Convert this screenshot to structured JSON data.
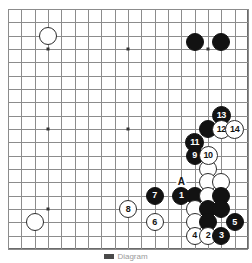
{
  "diagram": {
    "board_size": 19,
    "grid_lines": 19,
    "colors": {
      "board_background": "#ffffff",
      "grid_line": "#8c8c8c",
      "border": "#6b6b6b",
      "black_stone": "#121212",
      "white_stone": "#ffffff",
      "stone_outline": "#2b2b2b",
      "label_text": "#111111"
    },
    "star_points": [
      {
        "col": 3,
        "row": 3
      },
      {
        "col": 9,
        "row": 3
      },
      {
        "col": 15,
        "row": 3
      },
      {
        "col": 3,
        "row": 9
      },
      {
        "col": 9,
        "row": 9
      },
      {
        "col": 15,
        "row": 9
      },
      {
        "col": 3,
        "row": 15
      },
      {
        "col": 9,
        "row": 15
      },
      {
        "col": 15,
        "row": 15
      }
    ],
    "stones": [
      {
        "id": "w-upper-left",
        "color": "white",
        "label": "",
        "col": 3,
        "row": 2
      },
      {
        "id": "b-top-right-a",
        "color": "black",
        "label": "",
        "col": 14,
        "row": 2.5
      },
      {
        "id": "b-top-right-b",
        "color": "black",
        "label": "",
        "col": 16,
        "row": 2.5
      },
      {
        "id": "w-lower-left",
        "color": "white",
        "label": "",
        "col": 2,
        "row": 16
      },
      {
        "id": "move-13",
        "color": "black",
        "label": "13",
        "col": 16,
        "row": 8
      },
      {
        "id": "move-12",
        "color": "white",
        "label": "12",
        "col": 16,
        "row": 9
      },
      {
        "id": "move-14",
        "color": "white",
        "label": "14",
        "col": 17,
        "row": 9
      },
      {
        "id": "b-plain-1",
        "color": "black",
        "label": "",
        "col": 15,
        "row": 9
      },
      {
        "id": "move-11",
        "color": "black",
        "label": "11",
        "col": 14,
        "row": 10
      },
      {
        "id": "move-9",
        "color": "black",
        "label": "9",
        "col": 14,
        "row": 11
      },
      {
        "id": "move-10",
        "color": "white",
        "label": "10",
        "col": 15,
        "row": 11
      },
      {
        "id": "w-plain-1",
        "color": "white",
        "label": "",
        "col": 15,
        "row": 12
      },
      {
        "id": "w-plain-2",
        "color": "white",
        "label": "",
        "col": 15,
        "row": 13
      },
      {
        "id": "w-plain-3",
        "color": "white",
        "label": "",
        "col": 16,
        "row": 13
      },
      {
        "id": "move-1",
        "color": "black",
        "label": "1",
        "col": 13,
        "row": 14
      },
      {
        "id": "b-plain-2",
        "color": "black",
        "label": "",
        "col": 14,
        "row": 14
      },
      {
        "id": "w-plain-4",
        "color": "white",
        "label": "",
        "col": 15,
        "row": 14
      },
      {
        "id": "b-plain-3",
        "color": "black",
        "label": "",
        "col": 16,
        "row": 14
      },
      {
        "id": "move-7",
        "color": "black",
        "label": "7",
        "col": 11,
        "row": 14
      },
      {
        "id": "w-plain-5",
        "color": "white",
        "label": "",
        "col": 14,
        "row": 15
      },
      {
        "id": "b-plain-4",
        "color": "black",
        "label": "",
        "col": 15,
        "row": 15
      },
      {
        "id": "b-plain-5",
        "color": "black",
        "label": "",
        "col": 16,
        "row": 15
      },
      {
        "id": "move-8",
        "color": "white",
        "label": "8",
        "col": 9,
        "row": 15
      },
      {
        "id": "w-plain-6",
        "color": "white",
        "label": "",
        "col": 14,
        "row": 16
      },
      {
        "id": "b-plain-6",
        "color": "black",
        "label": "",
        "col": 15,
        "row": 16
      },
      {
        "id": "move-5",
        "color": "black",
        "label": "5",
        "col": 17,
        "row": 16
      },
      {
        "id": "move-6",
        "color": "white",
        "label": "6",
        "col": 11,
        "row": 16
      },
      {
        "id": "move-4",
        "color": "white",
        "label": "4",
        "col": 14,
        "row": 17
      },
      {
        "id": "move-2",
        "color": "white",
        "label": "2",
        "col": 15,
        "row": 17
      },
      {
        "id": "move-3",
        "color": "black",
        "label": "3",
        "col": 16,
        "row": 17
      }
    ],
    "markers": [
      {
        "id": "marker-a",
        "label": "A",
        "col": 13,
        "row": 13
      }
    ]
  },
  "caption": {
    "text": "Diagram"
  }
}
